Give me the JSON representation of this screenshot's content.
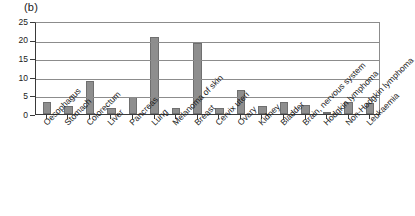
{
  "panel": {
    "label": "(b)"
  },
  "chart_data": {
    "type": "bar",
    "title": "(b)",
    "xlabel": "",
    "ylabel": "",
    "ylim": [
      0,
      25
    ],
    "yticks": [
      0,
      5,
      10,
      15,
      20,
      25
    ],
    "ytick_labels": [
      "0",
      "5",
      "10",
      "15",
      "20",
      "25"
    ],
    "grid": true,
    "legend": null,
    "bar_color": "#8e8e8e",
    "bar_edge_color": "#6f6f6f",
    "axis_color": "#3a3a3a",
    "grid_color": "#8c8c8c",
    "categories": [
      "Oesophagus",
      "Stomach",
      "Colorectum",
      "Liver",
      "Pancreas",
      "Lung",
      "Melanoma of skin",
      "Breast",
      "Cervix uteri",
      "Ovary",
      "Kidney",
      "Bladder",
      "Brain, nervous system",
      "Hodgkin lymphoma",
      "Non-Hodgkin lymphoma",
      "Leukaemia"
    ],
    "values": [
      3.2,
      2.2,
      9.0,
      1.7,
      4.7,
      20.7,
      1.6,
      19.0,
      1.5,
      6.5,
      2.2,
      3.2,
      2.5,
      0.3,
      3.2,
      3.0
    ]
  }
}
